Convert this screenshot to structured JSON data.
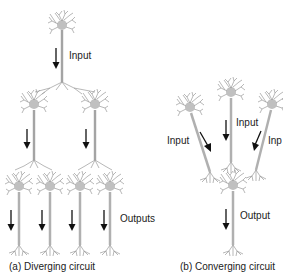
{
  "figure": {
    "panels": [
      {
        "id": "a",
        "caption": "(a) Diverging circuit",
        "labels": {
          "input": "Input",
          "outputs": "Outputs"
        },
        "structure": "1 input neuron -> 2 neurons -> 4 output neurons"
      },
      {
        "id": "b",
        "caption": "(b) Converging circuit",
        "labels": {
          "input_left": "Input",
          "input_center": "Input",
          "input_right": "Inp",
          "output": "Output"
        },
        "structure": "3 input neurons -> 1 output neuron"
      }
    ],
    "colors": {
      "neuron": "#9a9a9a",
      "neuron_dark": "#6e6e6e",
      "arrow": "#111111",
      "text": "#222222"
    }
  }
}
